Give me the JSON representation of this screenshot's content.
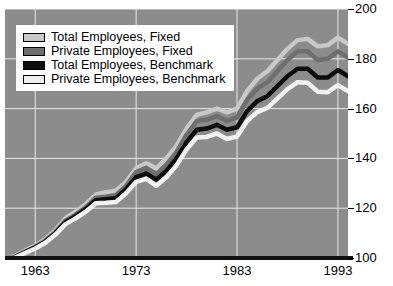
{
  "chart_data": {
    "type": "line",
    "title": "",
    "xlabel": "",
    "ylabel": "",
    "xlim": [
      1960,
      1994
    ],
    "ylim": [
      100,
      200
    ],
    "xticks": [
      1963,
      1973,
      1983,
      1993
    ],
    "yticks": [
      100,
      120,
      140,
      160,
      180,
      200
    ],
    "grid": true,
    "legend_position": "top-left",
    "plot_background": "#8c8c8c",
    "gridline_color": "#e8e8e8",
    "x": [
      1960,
      1961,
      1962,
      1963,
      1964,
      1965,
      1966,
      1967,
      1968,
      1969,
      1970,
      1971,
      1972,
      1973,
      1974,
      1975,
      1976,
      1977,
      1978,
      1979,
      1980,
      1981,
      1982,
      1983,
      1984,
      1985,
      1986,
      1987,
      1988,
      1989,
      1990,
      1991,
      1992,
      1993,
      1994
    ],
    "series": [
      {
        "name": "Total Employees, Fixed",
        "color": "#c9c9c9",
        "values": [
          100.0,
          100.8,
          103.0,
          105.0,
          107.6,
          111.2,
          116.0,
          118.6,
          121.6,
          125.5,
          126.4,
          127.0,
          130.6,
          136.0,
          138.0,
          136.0,
          140.0,
          145.0,
          152.0,
          157.5,
          158.5,
          160.0,
          158.5,
          160.0,
          167.0,
          172.0,
          175.0,
          179.5,
          184.0,
          187.5,
          188.0,
          185.0,
          185.5,
          188.5,
          186.0
        ]
      },
      {
        "name": "Private Employees, Fixed",
        "color": "#6e6e6e",
        "values": [
          100.0,
          100.5,
          102.6,
          104.5,
          107.0,
          110.5,
          115.0,
          117.4,
          120.3,
          124.2,
          124.6,
          125.2,
          129.0,
          134.5,
          136.2,
          133.6,
          137.5,
          142.5,
          149.5,
          155.0,
          155.5,
          157.0,
          155.0,
          156.5,
          163.5,
          168.0,
          170.5,
          175.0,
          179.5,
          183.0,
          183.0,
          179.5,
          180.0,
          183.0,
          180.5
        ]
      },
      {
        "name": "Total Employees, Benchmark",
        "color": "#0d0d0d",
        "values": [
          100.0,
          100.4,
          102.3,
          104.2,
          106.6,
          110.0,
          114.4,
          116.8,
          119.6,
          123.2,
          123.6,
          124.0,
          127.6,
          132.5,
          134.0,
          131.5,
          135.0,
          140.0,
          146.5,
          151.5,
          152.0,
          153.5,
          151.5,
          152.5,
          159.0,
          163.0,
          165.0,
          169.0,
          173.0,
          176.0,
          176.0,
          172.5,
          172.5,
          175.5,
          173.0
        ]
      },
      {
        "name": "Private Employees, Benchmark",
        "color": "#f2f2f2",
        "values": [
          100.0,
          100.2,
          102.0,
          103.8,
          106.1,
          109.4,
          113.6,
          115.9,
          118.6,
          122.0,
          122.2,
          122.5,
          126.0,
          130.6,
          131.8,
          129.0,
          132.4,
          137.2,
          143.6,
          148.4,
          148.6,
          150.0,
          147.8,
          148.8,
          155.0,
          158.6,
          160.3,
          164.0,
          167.8,
          170.6,
          170.4,
          166.8,
          166.6,
          169.4,
          167.0
        ]
      }
    ]
  },
  "legend": {
    "items": [
      {
        "label": "Total Employees, Fixed",
        "color": "#c9c9c9"
      },
      {
        "label": "Private Employees, Fixed",
        "color": "#6e6e6e"
      },
      {
        "label": "Total Employees, Benchmark",
        "color": "#0d0d0d"
      },
      {
        "label": "Private Employees, Benchmark",
        "color": "#efefef"
      }
    ]
  },
  "axes": {
    "y_labels": [
      "200",
      "180",
      "160",
      "140",
      "120",
      "100"
    ],
    "x_labels": [
      "1963",
      "1973",
      "1983",
      "1993"
    ]
  }
}
